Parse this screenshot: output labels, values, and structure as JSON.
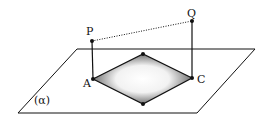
{
  "diagram": {
    "plane_label": "(α)",
    "points": {
      "P": {
        "label": "P",
        "x": 92,
        "y": 41
      },
      "Q": {
        "label": "Q",
        "x": 192,
        "y": 21
      },
      "A": {
        "label": "A",
        "x": 93,
        "y": 79
      },
      "C": {
        "label": "C",
        "x": 192,
        "y": 78
      },
      "B": {
        "label": "",
        "x": 143,
        "y": 54
      },
      "D": {
        "label": "",
        "x": 143,
        "y": 104
      }
    },
    "plane": [
      [
        77,
        49
      ],
      [
        255,
        49
      ],
      [
        197,
        113
      ],
      [
        18,
        113
      ]
    ],
    "segments": [
      {
        "from": "P",
        "to": "A",
        "style": "solid"
      },
      {
        "from": "Q",
        "to": "C",
        "style": "solid"
      },
      {
        "from": "P",
        "to": "Q",
        "style": "dotted"
      }
    ],
    "rhombus": [
      "A",
      "B",
      "C",
      "D"
    ],
    "colors": {
      "stroke": "#111111",
      "shade_dark": "#444444",
      "shade_light": "#ffffff"
    }
  }
}
